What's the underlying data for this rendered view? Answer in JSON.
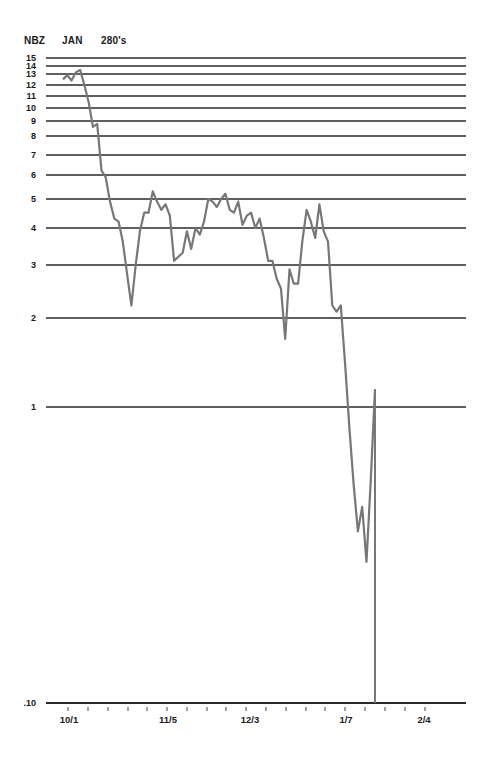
{
  "header": {
    "symbol": "NBZ",
    "month": "JAN",
    "strike": "280's"
  },
  "chart_data": {
    "type": "line",
    "xlabel": "",
    "ylabel": "",
    "y_scale": "log",
    "ylim": [
      0.1,
      15
    ],
    "grid": true,
    "legend": "none",
    "y_ticks": [
      "15",
      "14",
      "13",
      "12",
      "11",
      "10",
      "9",
      "8",
      "7",
      "6",
      "5",
      "4",
      "3",
      "2",
      "1",
      ".10"
    ],
    "x_ticks": [
      "10/1",
      "11/5",
      "12/3",
      "1/7",
      "2/4"
    ],
    "series": [
      {
        "name": "NBZ JAN 280's option price",
        "color": "#777777",
        "points": [
          [
            "9/29",
            12.5
          ],
          [
            "9/30",
            12.9
          ],
          [
            "10/1",
            12.4
          ],
          [
            "10/2",
            13.2
          ],
          [
            "10/3",
            13.5
          ],
          [
            "10/6",
            12.0
          ],
          [
            "10/7",
            10.5
          ],
          [
            "10/8",
            8.6
          ],
          [
            "10/9",
            8.8
          ],
          [
            "10/10",
            6.2
          ],
          [
            "10/13",
            5.9
          ],
          [
            "10/14",
            4.9
          ],
          [
            "10/15",
            4.3
          ],
          [
            "10/16",
            4.2
          ],
          [
            "10/17",
            3.6
          ],
          [
            "10/20",
            2.8
          ],
          [
            "10/21",
            2.2
          ],
          [
            "10/22",
            3.0
          ],
          [
            "10/23",
            3.9
          ],
          [
            "10/24",
            4.5
          ],
          [
            "10/27",
            4.5
          ],
          [
            "10/28",
            5.3
          ],
          [
            "10/29",
            4.9
          ],
          [
            "10/30",
            4.6
          ],
          [
            "10/31",
            4.8
          ],
          [
            "11/3",
            4.4
          ],
          [
            "11/4",
            3.1
          ],
          [
            "11/5",
            3.2
          ],
          [
            "11/6",
            3.3
          ],
          [
            "11/7",
            3.9
          ],
          [
            "11/10",
            3.4
          ],
          [
            "11/11",
            4.0
          ],
          [
            "11/12",
            3.8
          ],
          [
            "11/13",
            4.2
          ],
          [
            "11/14",
            5.0
          ],
          [
            "11/17",
            4.9
          ],
          [
            "11/18",
            4.7
          ],
          [
            "11/19",
            5.0
          ],
          [
            "11/20",
            5.2
          ],
          [
            "11/21",
            4.6
          ],
          [
            "11/24",
            4.5
          ],
          [
            "11/25",
            4.9
          ],
          [
            "11/26",
            4.1
          ],
          [
            "11/28",
            4.4
          ],
          [
            "12/1",
            4.5
          ],
          [
            "12/2",
            4.0
          ],
          [
            "12/3",
            4.3
          ],
          [
            "12/4",
            3.7
          ],
          [
            "12/5",
            3.1
          ],
          [
            "12/8",
            3.1
          ],
          [
            "12/9",
            2.7
          ],
          [
            "12/10",
            2.5
          ],
          [
            "12/11",
            1.7
          ],
          [
            "12/12",
            2.9
          ],
          [
            "12/15",
            2.6
          ],
          [
            "12/16",
            2.6
          ],
          [
            "12/17",
            3.6
          ],
          [
            "12/18",
            4.6
          ],
          [
            "12/19",
            4.2
          ],
          [
            "12/22",
            3.7
          ],
          [
            "12/23",
            4.8
          ],
          [
            "12/24",
            3.9
          ],
          [
            "12/26",
            3.6
          ],
          [
            "12/29",
            2.2
          ],
          [
            "12/30",
            2.1
          ],
          [
            "12/31",
            2.2
          ],
          [
            "1/2",
            1.4
          ],
          [
            "1/5",
            0.85
          ],
          [
            "1/6",
            0.55
          ],
          [
            "1/7",
            0.38
          ],
          [
            "1/8",
            0.46
          ],
          [
            "1/9",
            0.3
          ],
          [
            "1/12",
            0.56
          ],
          [
            "1/13",
            1.15
          ],
          [
            "1/14",
            0.1
          ]
        ]
      }
    ]
  }
}
